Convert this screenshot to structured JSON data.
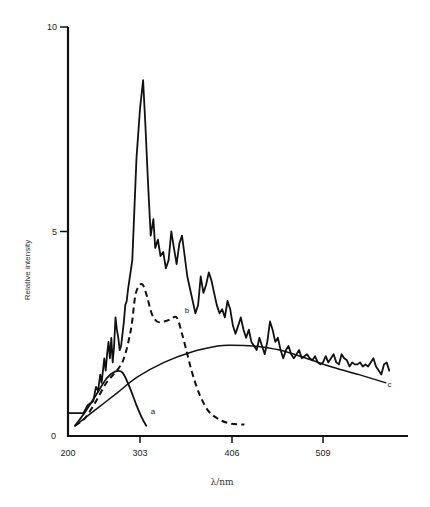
{
  "chart_data": {
    "type": "line",
    "title": "",
    "xlabel": "λ/nm",
    "ylabel": "Relative intensity",
    "xlim": [
      200,
      600
    ],
    "ylim": [
      0,
      10
    ],
    "grid": false,
    "legend": "none",
    "x_ticks": [
      200,
      303,
      406,
      509
    ],
    "x_tick_labels": [
      "200",
      "303",
      "406",
      "509"
    ],
    "y_ticks": [
      0,
      5,
      10
    ],
    "y_tick_labels": [
      "0",
      "5",
      "10"
    ],
    "series": [
      {
        "name": "measured spectrum",
        "style": "solid-noisy",
        "points": [
          [
            200,
            0.56
          ],
          [
            222,
            0.56
          ],
          [
            228,
            0.75
          ],
          [
            236,
            0.85
          ],
          [
            240,
            1.2
          ],
          [
            243,
            1.1
          ],
          [
            246,
            1.5
          ],
          [
            248,
            1.3
          ],
          [
            252,
            1.9
          ],
          [
            254,
            1.6
          ],
          [
            256,
            2.0
          ],
          [
            258,
            2.3
          ],
          [
            260,
            1.9
          ],
          [
            262,
            2.4
          ],
          [
            264,
            1.8
          ],
          [
            266,
            2.2
          ],
          [
            268,
            2.9
          ],
          [
            270,
            2.6
          ],
          [
            272,
            2.4
          ],
          [
            274,
            2.1
          ],
          [
            276,
            2.2
          ],
          [
            278,
            2.5
          ],
          [
            280,
            2.8
          ],
          [
            282,
            3.2
          ],
          [
            284,
            3.3
          ],
          [
            286,
            3.6
          ],
          [
            292,
            4.3
          ],
          [
            298,
            6.8
          ],
          [
            303,
            8.0
          ],
          [
            306.5,
            8.7
          ],
          [
            309,
            7.6
          ],
          [
            312,
            6.2
          ],
          [
            315,
            4.9
          ],
          [
            318,
            5.3
          ],
          [
            320,
            4.6
          ],
          [
            323,
            4.8
          ],
          [
            326,
            4.4
          ],
          [
            329,
            4.5
          ],
          [
            332,
            4.1
          ],
          [
            335,
            4.3
          ],
          [
            338,
            5.0
          ],
          [
            341,
            4.6
          ],
          [
            344,
            4.2
          ],
          [
            347,
            4.7
          ],
          [
            350,
            4.9
          ],
          [
            353,
            4.4
          ],
          [
            356,
            3.9
          ],
          [
            359,
            3.6
          ],
          [
            362,
            3.3
          ],
          [
            365,
            3.0
          ],
          [
            368,
            3.2
          ],
          [
            371,
            3.9
          ],
          [
            374,
            3.5
          ],
          [
            377,
            3.7
          ],
          [
            380,
            4.0
          ],
          [
            383,
            3.8
          ],
          [
            386,
            3.5
          ],
          [
            389,
            3.2
          ],
          [
            392,
            3.0
          ],
          [
            395,
            3.1
          ],
          [
            398,
            2.9
          ],
          [
            401,
            3.3
          ],
          [
            404,
            3.1
          ],
          [
            407,
            2.7
          ],
          [
            410,
            2.5
          ],
          [
            413,
            2.7
          ],
          [
            416,
            2.9
          ],
          [
            419,
            2.6
          ],
          [
            422,
            2.4
          ],
          [
            425,
            2.6
          ],
          [
            428,
            2.3
          ],
          [
            431,
            2.2
          ],
          [
            434,
            2.1
          ],
          [
            437,
            2.4
          ],
          [
            440,
            2.2
          ],
          [
            443,
            2.0
          ],
          [
            446,
            2.3
          ],
          [
            449,
            2.8
          ],
          [
            452,
            2.6
          ],
          [
            455,
            2.3
          ],
          [
            458,
            2.4
          ],
          [
            461,
            2.1
          ],
          [
            464,
            1.9
          ],
          [
            467,
            2.1
          ],
          [
            470,
            2.2
          ],
          [
            473,
            2.0
          ],
          [
            476,
            1.9
          ],
          [
            479,
            2.0
          ],
          [
            482,
            2.1
          ],
          [
            485,
            1.9
          ],
          [
            488,
            1.95
          ],
          [
            491,
            2.0
          ],
          [
            494,
            1.9
          ],
          [
            497,
            1.85
          ],
          [
            500,
            1.95
          ],
          [
            503,
            1.8
          ],
          [
            506,
            1.75
          ],
          [
            509,
            1.8
          ],
          [
            512,
            1.95
          ],
          [
            515,
            1.8
          ],
          [
            518,
            1.9
          ],
          [
            521,
            2.0
          ],
          [
            524,
            1.8
          ],
          [
            527,
            1.75
          ],
          [
            530,
            2.0
          ],
          [
            533,
            1.9
          ],
          [
            536,
            1.85
          ],
          [
            539,
            1.7
          ],
          [
            542,
            1.8
          ],
          [
            545,
            1.75
          ],
          [
            548,
            1.75
          ],
          [
            551,
            1.8
          ],
          [
            554,
            1.7
          ],
          [
            557,
            1.75
          ],
          [
            560,
            1.7
          ],
          [
            563,
            1.8
          ],
          [
            566,
            1.9
          ],
          [
            569,
            1.7
          ],
          [
            572,
            1.6
          ],
          [
            575,
            1.5
          ],
          [
            578,
            1.75
          ],
          [
            581,
            1.8
          ],
          [
            584,
            1.6
          ]
        ]
      },
      {
        "name": "a",
        "style": "solid",
        "points": [
          [
            210,
            0.25
          ],
          [
            225,
            0.6
          ],
          [
            240,
            1.0
          ],
          [
            255,
            1.4
          ],
          [
            268,
            1.58
          ],
          [
            278,
            1.55
          ],
          [
            288,
            1.2
          ],
          [
            298,
            0.75
          ],
          [
            305,
            0.45
          ],
          [
            310,
            0.25
          ]
        ]
      },
      {
        "name": "b",
        "style": "dashed",
        "points": [
          [
            210,
            0.25
          ],
          [
            225,
            0.45
          ],
          [
            240,
            0.85
          ],
          [
            255,
            1.3
          ],
          [
            270,
            1.6
          ],
          [
            280,
            1.9
          ],
          [
            290,
            2.6
          ],
          [
            296,
            3.4
          ],
          [
            301,
            3.65
          ],
          [
            306,
            3.7
          ],
          [
            311,
            3.4
          ],
          [
            316,
            3.0
          ],
          [
            322,
            2.8
          ],
          [
            330,
            2.8
          ],
          [
            337,
            2.85
          ],
          [
            344,
            2.9
          ],
          [
            350,
            2.5
          ],
          [
            356,
            2.0
          ],
          [
            362,
            1.5
          ],
          [
            370,
            1.0
          ],
          [
            380,
            0.6
          ],
          [
            392,
            0.4
          ],
          [
            405,
            0.3
          ],
          [
            420,
            0.28
          ]
        ]
      },
      {
        "name": "c",
        "style": "solid-smooth",
        "points": [
          [
            210,
            0.25
          ],
          [
            240,
            0.65
          ],
          [
            270,
            1.05
          ],
          [
            300,
            1.45
          ],
          [
            330,
            1.8
          ],
          [
            360,
            2.05
          ],
          [
            390,
            2.2
          ],
          [
            406,
            2.22
          ],
          [
            430,
            2.2
          ],
          [
            460,
            2.1
          ],
          [
            490,
            1.9
          ],
          [
            520,
            1.68
          ],
          [
            550,
            1.5
          ],
          [
            580,
            1.3
          ]
        ]
      }
    ],
    "annotations": [
      {
        "text": "a",
        "x": 315,
        "y": 0.55
      },
      {
        "text": "b",
        "x": 353,
        "y": 3.0
      },
      {
        "text": "c",
        "x": 582,
        "y": 1.2
      }
    ]
  }
}
